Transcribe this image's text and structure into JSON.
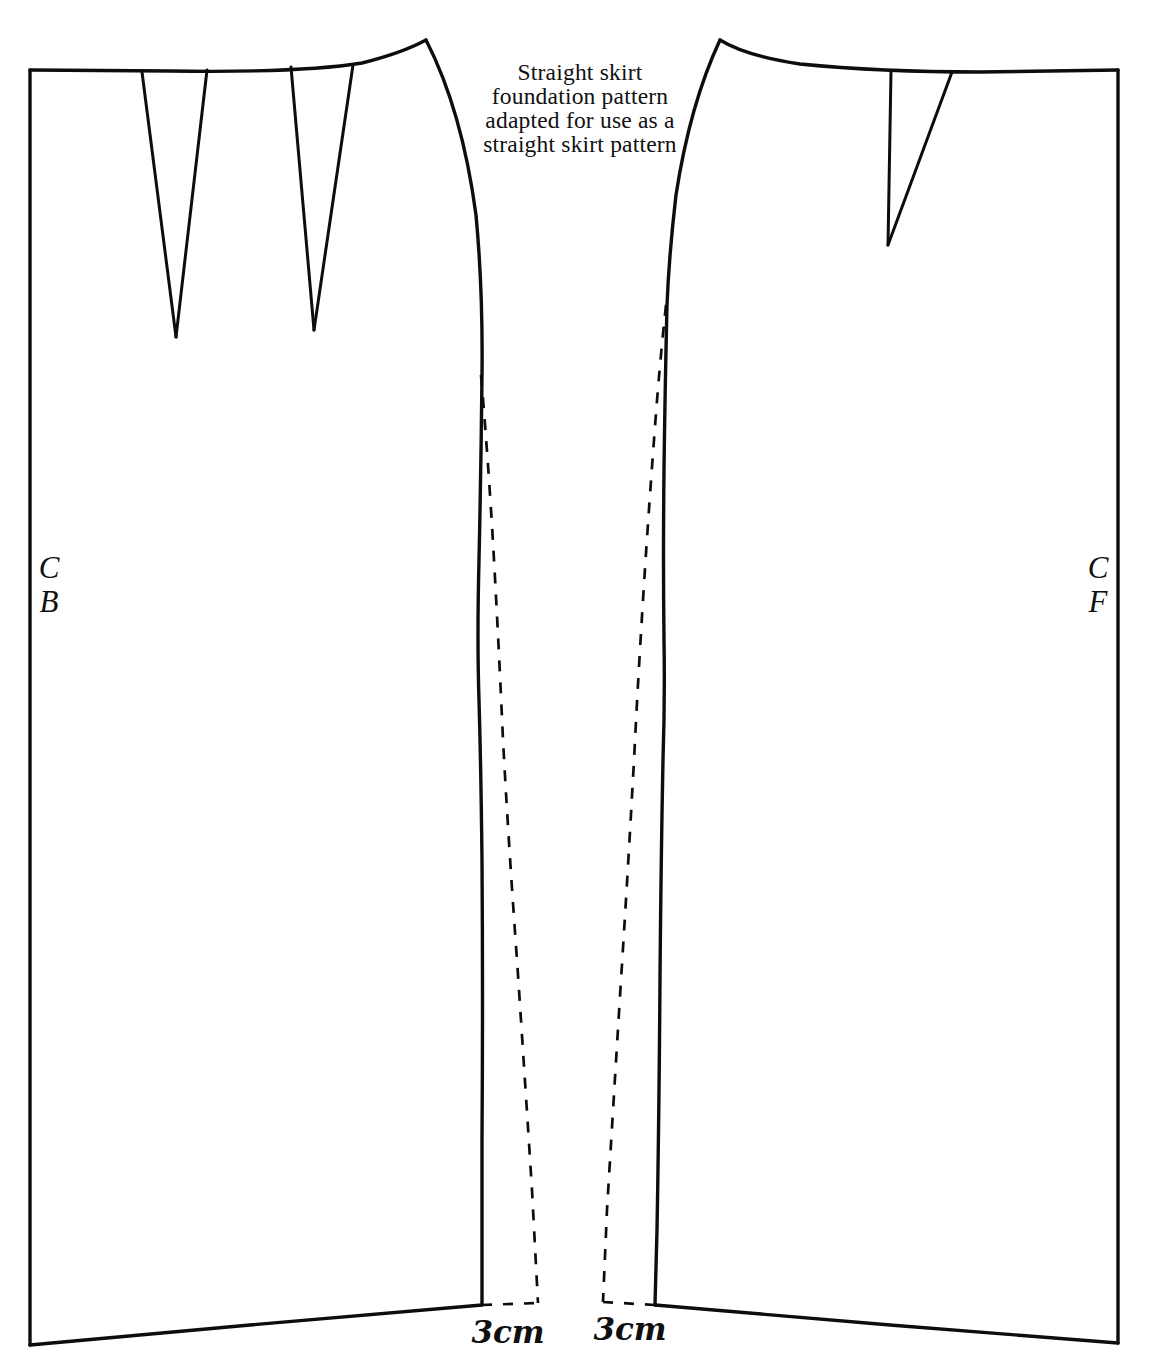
{
  "figure": {
    "title": "Straight skirt foundation pattern adapted for use as a straight skirt pattern",
    "caption_lines": [
      "Straight skirt",
      "foundation pattern",
      "adapted for use as a",
      "straight skirt pattern"
    ],
    "line_color": "#0d0d0d",
    "background_color": "#ffffff"
  },
  "back_panel": {
    "name": "skirt-back-panel",
    "fold_label_lines": [
      "C",
      "B"
    ],
    "fold_label": "CB",
    "darts": [
      {
        "name": "back-dart-1",
        "label": ""
      },
      {
        "name": "back-dart-2",
        "label": ""
      }
    ],
    "hem_extension_label": "3cm"
  },
  "front_panel": {
    "name": "skirt-front-panel",
    "fold_label_lines": [
      "C",
      "F"
    ],
    "fold_label": "CF",
    "darts": [
      {
        "name": "front-dart-1",
        "label": ""
      }
    ],
    "hem_extension_label": "3cm"
  },
  "measurements": {
    "back_hem_extension": "3cm",
    "front_hem_extension": "3cm"
  }
}
